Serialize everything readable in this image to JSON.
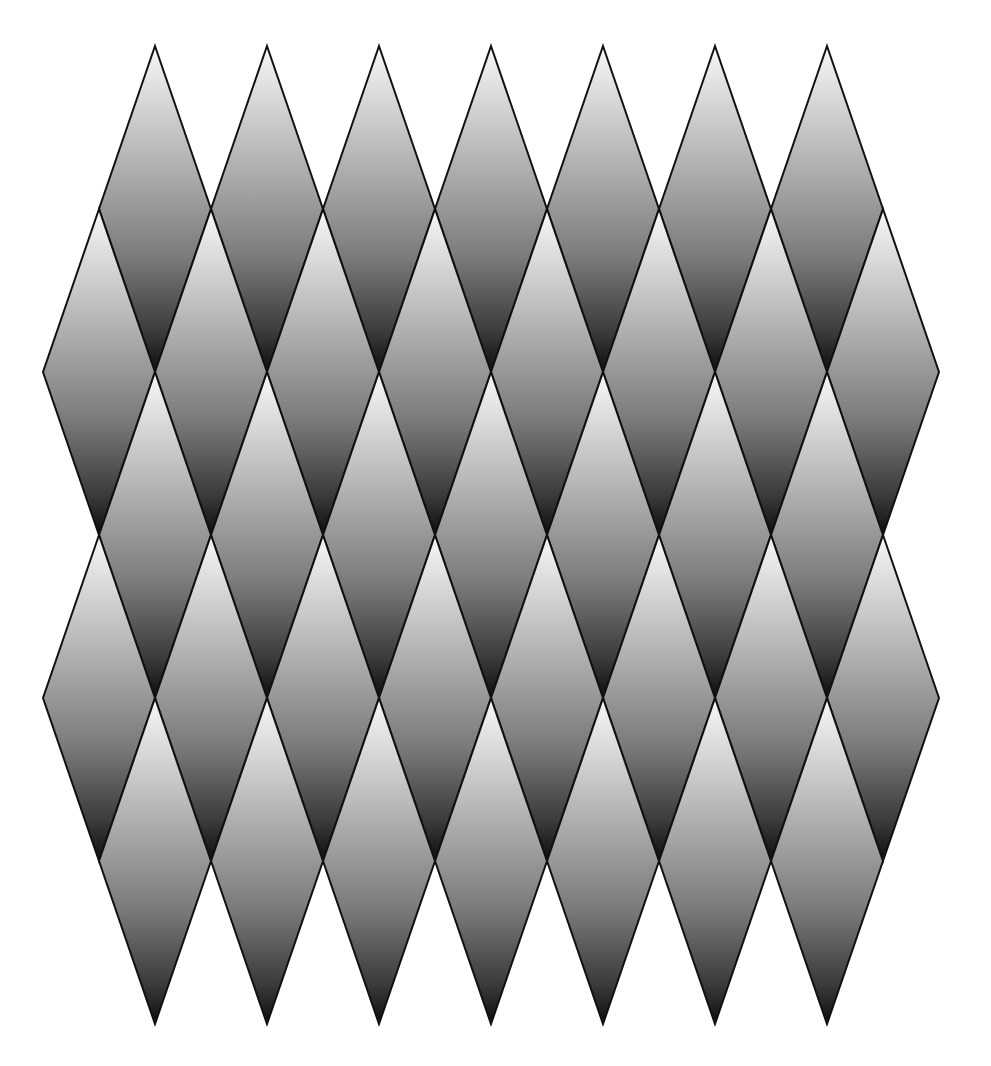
{
  "figure": {
    "background": "#ffffff"
  },
  "pattern": {
    "diamond_width": 112,
    "diamond_half_height": 163,
    "stroke_color": "#111111",
    "stroke_width": 2,
    "gradient": {
      "direction": "top-to-bottom",
      "stops": [
        {
          "offset": "0%",
          "color": "#f7f7f7"
        },
        {
          "offset": "35%",
          "color": "#b4b4b4"
        },
        {
          "offset": "65%",
          "color": "#7a7a7a"
        },
        {
          "offset": "88%",
          "color": "#3a3a3a"
        },
        {
          "offset": "100%",
          "color": "#0e0e0e"
        }
      ]
    },
    "rows": [
      {
        "center_y": 209,
        "centers_x": [
          155,
          267,
          379,
          491,
          603,
          715,
          827
        ]
      },
      {
        "center_y": 372,
        "centers_x": [
          99,
          211,
          323,
          435,
          547,
          659,
          771,
          883
        ]
      },
      {
        "center_y": 535,
        "centers_x": [
          155,
          267,
          379,
          491,
          603,
          715,
          827
        ]
      },
      {
        "center_y": 698,
        "centers_x": [
          99,
          211,
          323,
          435,
          547,
          659,
          771,
          883
        ]
      },
      {
        "center_y": 861,
        "centers_x": [
          155,
          267,
          379,
          491,
          603,
          715,
          827
        ]
      }
    ]
  }
}
